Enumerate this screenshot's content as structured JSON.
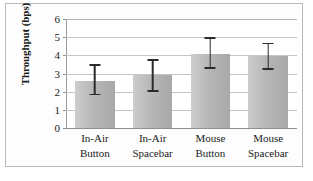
{
  "chart_data": {
    "type": "bar",
    "title": "",
    "xlabel": "",
    "ylabel": "Throughput (bps)",
    "categories": [
      "In-Air Button",
      "In-Air Spacebar",
      "Mouse Button",
      "Mouse Spacebar"
    ],
    "category_lines": [
      [
        "In-Air",
        "Button"
      ],
      [
        "In-Air",
        "Spacebar"
      ],
      [
        "Mouse",
        "Button"
      ],
      [
        "Mouse",
        "Spacebar"
      ]
    ],
    "values": [
      2.6,
      2.9,
      4.1,
      3.95
    ],
    "error_low": [
      1.8,
      2.0,
      3.25,
      3.2
    ],
    "error_high": [
      3.5,
      3.8,
      5.0,
      4.7
    ],
    "ylim": [
      0,
      6
    ],
    "yticks": [
      0,
      1,
      2,
      3,
      4,
      5,
      6
    ],
    "ytick_labels": [
      "0",
      "1",
      "2",
      "3",
      "4",
      "5",
      "6"
    ],
    "grid": true,
    "legend": false,
    "bar_color": "#b7b7b7",
    "error_color": "#2b2b2b",
    "grid_color": "#c4c4c4",
    "axis_color": "#8f8f8f"
  }
}
